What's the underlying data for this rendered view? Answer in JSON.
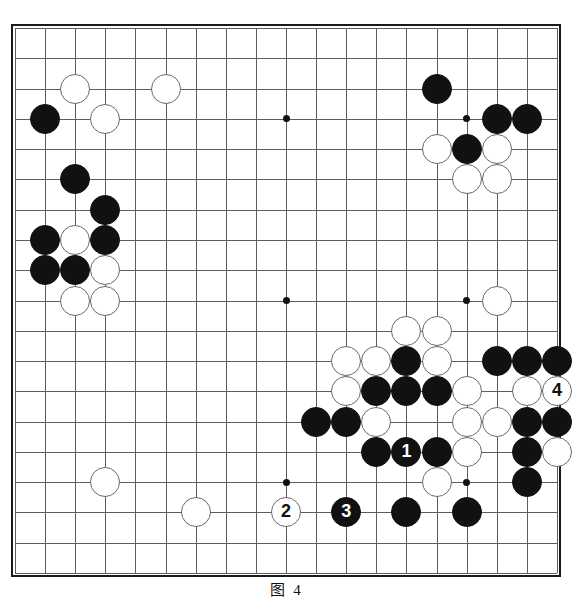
{
  "figure": {
    "caption": "图 4",
    "kind": "go-board-diagram"
  },
  "board": {
    "size": 19,
    "grid_color": "#5d5d5d",
    "border_color": "#1a1a1a",
    "background": "#ffffff",
    "black_color": "#111111",
    "white_color": "#ffffff",
    "star_points": [
      {
        "col": 3,
        "row": 3
      },
      {
        "col": 9,
        "row": 3
      },
      {
        "col": 15,
        "row": 3
      },
      {
        "col": 3,
        "row": 9
      },
      {
        "col": 9,
        "row": 9
      },
      {
        "col": 15,
        "row": 9
      },
      {
        "col": 3,
        "row": 15
      },
      {
        "col": 9,
        "row": 15
      },
      {
        "col": 15,
        "row": 15
      }
    ],
    "stones": [
      {
        "col": 2,
        "row": 2,
        "color": "white",
        "label": ""
      },
      {
        "col": 5,
        "row": 2,
        "color": "white",
        "label": ""
      },
      {
        "col": 14,
        "row": 2,
        "color": "black",
        "label": ""
      },
      {
        "col": 1,
        "row": 3,
        "color": "black",
        "label": ""
      },
      {
        "col": 3,
        "row": 3,
        "color": "white",
        "label": ""
      },
      {
        "col": 16,
        "row": 3,
        "color": "black",
        "label": ""
      },
      {
        "col": 17,
        "row": 3,
        "color": "black",
        "label": ""
      },
      {
        "col": 14,
        "row": 4,
        "color": "white",
        "label": ""
      },
      {
        "col": 15,
        "row": 4,
        "color": "black",
        "label": ""
      },
      {
        "col": 16,
        "row": 4,
        "color": "white",
        "label": ""
      },
      {
        "col": 15,
        "row": 5,
        "color": "white",
        "label": ""
      },
      {
        "col": 16,
        "row": 5,
        "color": "white",
        "label": ""
      },
      {
        "col": 2,
        "row": 5,
        "color": "black",
        "label": ""
      },
      {
        "col": 3,
        "row": 6,
        "color": "black",
        "label": ""
      },
      {
        "col": 1,
        "row": 7,
        "color": "black",
        "label": ""
      },
      {
        "col": 2,
        "row": 7,
        "color": "white",
        "label": ""
      },
      {
        "col": 3,
        "row": 7,
        "color": "black",
        "label": ""
      },
      {
        "col": 1,
        "row": 8,
        "color": "black",
        "label": ""
      },
      {
        "col": 2,
        "row": 8,
        "color": "black",
        "label": ""
      },
      {
        "col": 3,
        "row": 8,
        "color": "white",
        "label": ""
      },
      {
        "col": 2,
        "row": 9,
        "color": "white",
        "label": ""
      },
      {
        "col": 3,
        "row": 9,
        "color": "white",
        "label": ""
      },
      {
        "col": 16,
        "row": 9,
        "color": "white",
        "label": ""
      },
      {
        "col": 13,
        "row": 10,
        "color": "white",
        "label": ""
      },
      {
        "col": 14,
        "row": 10,
        "color": "white",
        "label": ""
      },
      {
        "col": 11,
        "row": 11,
        "color": "white",
        "label": ""
      },
      {
        "col": 12,
        "row": 11,
        "color": "white",
        "label": ""
      },
      {
        "col": 13,
        "row": 11,
        "color": "black",
        "label": ""
      },
      {
        "col": 14,
        "row": 11,
        "color": "white",
        "label": ""
      },
      {
        "col": 16,
        "row": 11,
        "color": "black",
        "label": ""
      },
      {
        "col": 17,
        "row": 11,
        "color": "black",
        "label": ""
      },
      {
        "col": 18,
        "row": 11,
        "color": "black",
        "label": ""
      },
      {
        "col": 11,
        "row": 12,
        "color": "white",
        "label": ""
      },
      {
        "col": 12,
        "row": 12,
        "color": "black",
        "label": ""
      },
      {
        "col": 13,
        "row": 12,
        "color": "black",
        "label": ""
      },
      {
        "col": 14,
        "row": 12,
        "color": "black",
        "label": ""
      },
      {
        "col": 15,
        "row": 12,
        "color": "white",
        "label": ""
      },
      {
        "col": 17,
        "row": 12,
        "color": "white",
        "label": ""
      },
      {
        "col": 18,
        "row": 12,
        "color": "white",
        "label": "4"
      },
      {
        "col": 10,
        "row": 13,
        "color": "black",
        "label": ""
      },
      {
        "col": 11,
        "row": 13,
        "color": "black",
        "label": ""
      },
      {
        "col": 12,
        "row": 13,
        "color": "white",
        "label": ""
      },
      {
        "col": 15,
        "row": 13,
        "color": "white",
        "label": ""
      },
      {
        "col": 16,
        "row": 13,
        "color": "white",
        "label": ""
      },
      {
        "col": 17,
        "row": 13,
        "color": "black",
        "label": ""
      },
      {
        "col": 18,
        "row": 13,
        "color": "black",
        "label": ""
      },
      {
        "col": 12,
        "row": 14,
        "color": "black",
        "label": ""
      },
      {
        "col": 13,
        "row": 14,
        "color": "black",
        "label": "1"
      },
      {
        "col": 14,
        "row": 14,
        "color": "black",
        "label": ""
      },
      {
        "col": 15,
        "row": 14,
        "color": "white",
        "label": ""
      },
      {
        "col": 17,
        "row": 14,
        "color": "black",
        "label": ""
      },
      {
        "col": 18,
        "row": 14,
        "color": "white",
        "label": ""
      },
      {
        "col": 3,
        "row": 15,
        "color": "white",
        "label": ""
      },
      {
        "col": 14,
        "row": 15,
        "color": "white",
        "label": ""
      },
      {
        "col": 17,
        "row": 15,
        "color": "black",
        "label": ""
      },
      {
        "col": 6,
        "row": 16,
        "color": "white",
        "label": ""
      },
      {
        "col": 9,
        "row": 16,
        "color": "white",
        "label": "2"
      },
      {
        "col": 11,
        "row": 16,
        "color": "black",
        "label": "3"
      },
      {
        "col": 13,
        "row": 16,
        "color": "black",
        "label": ""
      },
      {
        "col": 15,
        "row": 16,
        "color": "black",
        "label": ""
      }
    ]
  },
  "moves": [
    {
      "number": "1",
      "color": "black",
      "col": 13,
      "row": 14
    },
    {
      "number": "2",
      "color": "white",
      "col": 9,
      "row": 16
    },
    {
      "number": "3",
      "color": "black",
      "col": 11,
      "row": 16
    },
    {
      "number": "4",
      "color": "white",
      "col": 18,
      "row": 12
    }
  ]
}
